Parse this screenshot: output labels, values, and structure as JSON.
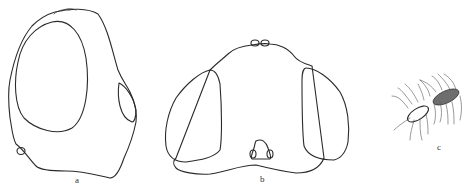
{
  "figure": {
    "panels": [
      {
        "id": "a",
        "label": "a",
        "description": "head, lateral view"
      },
      {
        "id": "b",
        "label": "b",
        "description": "head, frontal view"
      },
      {
        "id": "c",
        "label": "c",
        "description": "antenna"
      }
    ]
  },
  "colors": {
    "line": "#2a2a2a",
    "antenna_segment_dark": "#6e6e6e",
    "background": "#ffffff"
  }
}
